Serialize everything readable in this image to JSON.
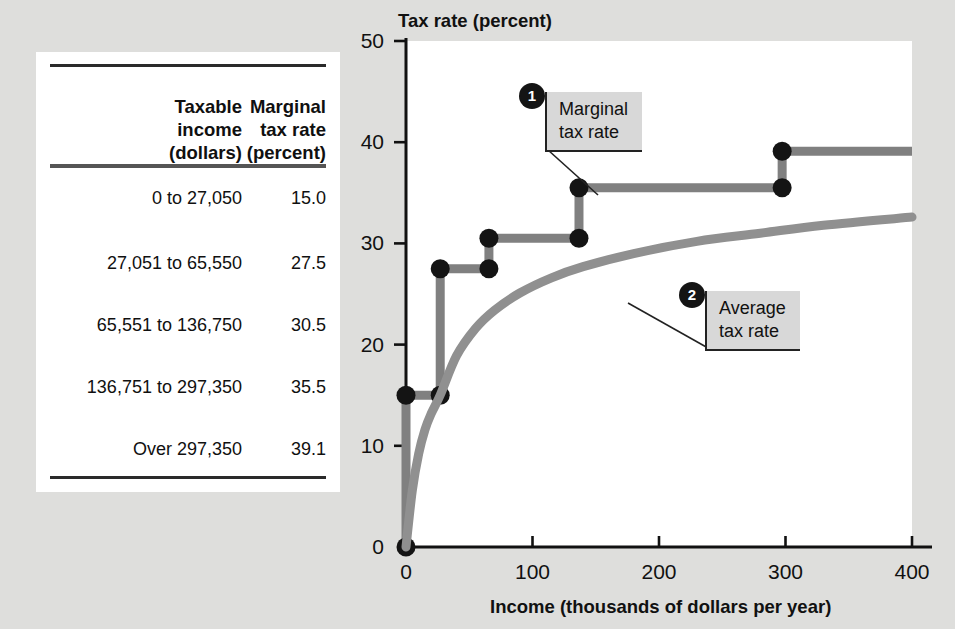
{
  "table": {
    "headers": [
      {
        "lines": [
          "Taxable",
          "income",
          "(dollars)"
        ]
      },
      {
        "lines": [
          "Marginal",
          "tax rate",
          "(percent)"
        ]
      }
    ],
    "rows": [
      {
        "range": "0 to 27,050",
        "rate": "15.0"
      },
      {
        "range": "27,051 to 65,550",
        "rate": "27.5"
      },
      {
        "range": "65,551 to 136,750",
        "rate": "30.5"
      },
      {
        "range": "136,751 to 297,350",
        "rate": "35.5"
      },
      {
        "range": "Over 297,350",
        "rate": "39.1"
      }
    ]
  },
  "callouts": {
    "one": {
      "number": "1",
      "line1": "Marginal",
      "line2": "tax rate"
    },
    "two": {
      "number": "2",
      "line1": "Average",
      "line2": "tax rate"
    }
  },
  "chart_data": {
    "type": "line",
    "title": "",
    "ylabel": "Tax rate (percent)",
    "xlabel": "Income (thousands of dollars per year)",
    "xlim": [
      0,
      400
    ],
    "ylim": [
      0,
      50
    ],
    "xticks": [
      0,
      100,
      200,
      300,
      400
    ],
    "xtick_labels": [
      "0",
      "100",
      "200",
      "300",
      "400"
    ],
    "yticks": [
      0,
      10,
      20,
      30,
      40,
      50
    ],
    "ytick_labels": [
      "0",
      "10",
      "20",
      "30",
      "40",
      "50"
    ],
    "grid": false,
    "legend_position": "inline-callouts",
    "series": [
      {
        "name": "Marginal tax rate",
        "kind": "step",
        "color": "#808080",
        "marker_color": "#141414",
        "breakpoints_thousands": [
          0,
          27.05,
          65.55,
          136.75,
          297.35,
          400
        ],
        "rates_percent": [
          15.0,
          27.5,
          30.5,
          35.5,
          39.1
        ],
        "points": [
          {
            "x": 0,
            "y": 0,
            "marker": true
          },
          {
            "x": 0,
            "y": 15.0,
            "marker": true
          },
          {
            "x": 27.05,
            "y": 15.0,
            "marker": true
          },
          {
            "x": 27.05,
            "y": 27.5,
            "marker": true
          },
          {
            "x": 65.55,
            "y": 27.5,
            "marker": true
          },
          {
            "x": 65.55,
            "y": 30.5,
            "marker": true
          },
          {
            "x": 136.75,
            "y": 30.5,
            "marker": true
          },
          {
            "x": 136.75,
            "y": 35.5,
            "marker": true
          },
          {
            "x": 297.35,
            "y": 35.5,
            "marker": true
          },
          {
            "x": 297.35,
            "y": 39.1,
            "marker": true
          },
          {
            "x": 400,
            "y": 39.1,
            "marker": false
          }
        ]
      },
      {
        "name": "Average tax rate",
        "kind": "curve",
        "color": "#909090",
        "points": [
          {
            "x": 0,
            "y": 0
          },
          {
            "x": 5,
            "y": 5.6
          },
          {
            "x": 10,
            "y": 9.2
          },
          {
            "x": 15,
            "y": 11.6
          },
          {
            "x": 20,
            "y": 13.2
          },
          {
            "x": 27,
            "y": 15.0
          },
          {
            "x": 40,
            "y": 18.9
          },
          {
            "x": 55,
            "y": 21.6
          },
          {
            "x": 70,
            "y": 23.4
          },
          {
            "x": 90,
            "y": 25.1
          },
          {
            "x": 115,
            "y": 26.6
          },
          {
            "x": 140,
            "y": 27.7
          },
          {
            "x": 180,
            "y": 29.0
          },
          {
            "x": 230,
            "y": 30.2
          },
          {
            "x": 280,
            "y": 31.0
          },
          {
            "x": 330,
            "y": 31.8
          },
          {
            "x": 400,
            "y": 32.6
          }
        ]
      }
    ]
  },
  "colors": {
    "page_background": "#dededc",
    "panel_background": "#ffffff",
    "line_gray": "#808080",
    "marker_black": "#141414",
    "callout_background": "#d8d8d8",
    "axis_black": "#111111"
  }
}
